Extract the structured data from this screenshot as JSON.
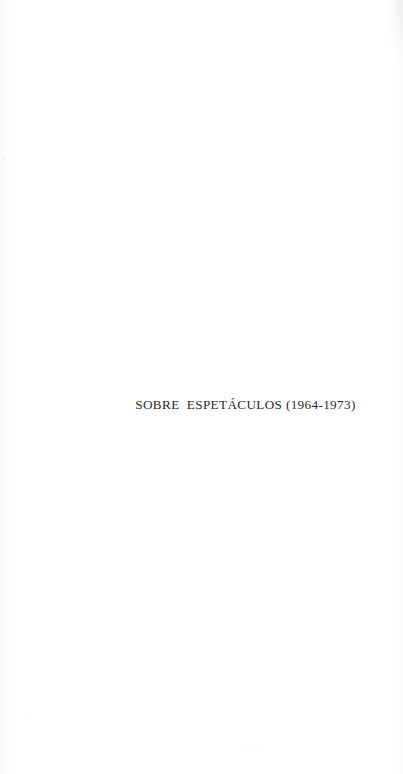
{
  "page": {
    "kind": "scanned-book-part-title-page",
    "background_color": "#ffffff",
    "width_px": 403,
    "height_px": 774
  },
  "content": {
    "part_title": "SOBRE  ESPETÁCULOS (1964-1973)",
    "title_words": [
      "SOBRE",
      "ESPETÁCULOS",
      "(1964-1973)"
    ],
    "date_range": "1964-1973",
    "year_start": "1964",
    "year_end": "1973",
    "text_color": "#2a2a28"
  },
  "artifacts": {
    "left_edge_shadow": "scan-shadow-left",
    "top_right_corner_shadow": "scan-shadow-corner",
    "right_edge_shadow": "scan-shadow-right",
    "specks": [
      {
        "x": 28,
        "y": 716,
        "w": 2,
        "h": 2
      },
      {
        "x": 246,
        "y": 746,
        "w": 2,
        "h": 1
      },
      {
        "x": 255,
        "y": 748,
        "w": 2,
        "h": 2
      },
      {
        "x": 3,
        "y": 158,
        "w": 2,
        "h": 2
      },
      {
        "x": 2,
        "y": 179,
        "w": 2,
        "h": 2
      }
    ]
  }
}
